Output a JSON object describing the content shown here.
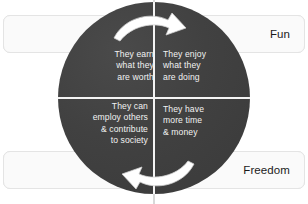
{
  "diagram": {
    "colors": {
      "circle_fill": "#414141",
      "divider": "#f4f4f4",
      "box_fill": "#fafafa",
      "box_border": "#e4e4e4",
      "quadrant_text": "#f2f2f2",
      "label_text": "#1a1a1a",
      "arrow_stroke": "#ffffff"
    },
    "corner_labels": [
      {
        "id": "worth",
        "text": "Worth",
        "position": "top-left"
      },
      {
        "id": "fun",
        "text": "Fun",
        "position": "top-right"
      },
      {
        "id": "contribute",
        "text": "Contribute",
        "position": "bottom-left"
      },
      {
        "id": "freedom",
        "text": "Freedom",
        "position": "bottom-right"
      }
    ],
    "quadrants": [
      {
        "id": "top-left",
        "related_label": "Worth",
        "lines": [
          "They earn",
          "what they",
          "are worth"
        ]
      },
      {
        "id": "top-right",
        "related_label": "Fun",
        "lines": [
          "They enjoy",
          "what they",
          "are doing"
        ]
      },
      {
        "id": "bottom-left",
        "related_label": "Contribute",
        "lines": [
          "They can",
          "employ others",
          "& contribute",
          "to society"
        ]
      },
      {
        "id": "bottom-right",
        "related_label": "Freedom",
        "lines": [
          "They have",
          "more time",
          "& money"
        ]
      }
    ],
    "arrows": [
      {
        "id": "top-arrow",
        "direction": "clockwise",
        "points": "left-to-right"
      },
      {
        "id": "bottom-arrow",
        "direction": "clockwise",
        "points": "right-to-left"
      }
    ]
  }
}
